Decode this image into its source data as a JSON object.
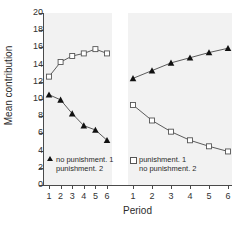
{
  "chart_data": {
    "type": "line",
    "title": "",
    "xlabel": "Period",
    "ylabel": "Mean contribution",
    "ylim": [
      0,
      20
    ],
    "ytick_step": 2,
    "yticks": [
      20,
      18,
      16,
      14,
      12,
      10,
      8,
      6,
      4,
      2,
      0
    ],
    "grid": false,
    "legend_position": "inside-bottom",
    "panels": [
      {
        "name": "panel-1",
        "x": [
          1,
          2,
          3,
          4,
          5,
          6
        ],
        "xticklabels": [
          "1",
          "2",
          "3",
          "4",
          "5",
          "6"
        ]
      },
      {
        "name": "panel-2",
        "x": [
          1,
          2,
          3,
          4,
          5,
          6
        ],
        "xticklabels": [
          "1",
          "2",
          "3",
          "4",
          "5",
          "6"
        ]
      }
    ],
    "series": [
      {
        "name": "punishment. 1",
        "panel": "panel-1",
        "marker": "open-square",
        "color": "#555555",
        "x": [
          1,
          2,
          3,
          4,
          5,
          6
        ],
        "values": [
          12.6,
          14.3,
          15.0,
          15.3,
          15.8,
          15.3
        ]
      },
      {
        "name": "no punishment. 1",
        "panel": "panel-1",
        "marker": "filled-triangle",
        "color": "#111111",
        "x": [
          1,
          2,
          3,
          4,
          5,
          6
        ],
        "values": [
          10.5,
          9.9,
          8.3,
          6.9,
          6.4,
          5.2
        ]
      },
      {
        "name": "punishment. 2",
        "panel": "panel-2",
        "marker": "filled-triangle",
        "color": "#111111",
        "x": [
          1,
          2,
          3,
          4,
          5,
          6
        ],
        "values": [
          12.4,
          13.3,
          14.2,
          14.8,
          15.4,
          15.9
        ]
      },
      {
        "name": "no punishment. 2",
        "panel": "panel-2",
        "marker": "open-square",
        "color": "#555555",
        "x": [
          1,
          2,
          3,
          4,
          5,
          6
        ],
        "values": [
          9.3,
          7.5,
          6.2,
          5.2,
          4.5,
          3.9
        ]
      }
    ],
    "legend": [
      {
        "marker": "filled-triangle",
        "line_1": "no punishment. 1",
        "line_2": "punishment. 2"
      },
      {
        "marker": "open-square",
        "line_1": "punishment. 1",
        "line_2": "no punishment. 2"
      }
    ]
  },
  "axis": {
    "ylabel": "Mean contribution",
    "xlabel": "Period"
  }
}
